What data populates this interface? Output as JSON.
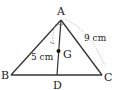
{
  "diagram": {
    "type": "triangle-with-median",
    "vertices": {
      "A": {
        "label": "A",
        "x": 61,
        "y": 20
      },
      "B": {
        "label": "B",
        "x": 11,
        "y": 75
      },
      "C": {
        "label": "C",
        "x": 102,
        "y": 75
      }
    },
    "points": {
      "D": {
        "label": "D",
        "x": 57,
        "y": 75
      },
      "G": {
        "label": "G",
        "x": 58.5,
        "y": 51
      }
    },
    "dimensions": {
      "AG": "5 cm",
      "AC": "9 cm"
    },
    "colors": {
      "stroke": "#333333",
      "dimension": "#999999"
    }
  }
}
